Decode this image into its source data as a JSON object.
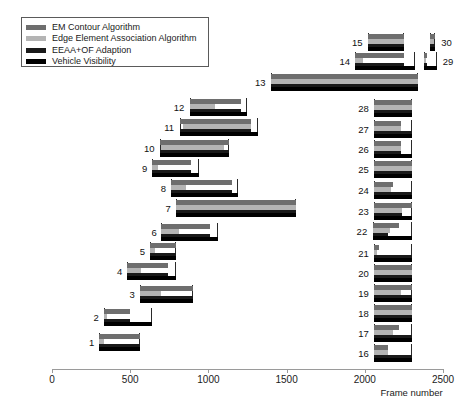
{
  "chart_data": {
    "type": "bar",
    "title": "",
    "xlabel": "Frame number",
    "ylabel": "",
    "xlim": [
      0,
      2500
    ],
    "xticks": [
      0,
      500,
      1000,
      1500,
      2000,
      2500
    ],
    "xticklabels": [
      "0",
      "500",
      "1000",
      "1500",
      "2000",
      "2500"
    ],
    "grid": false,
    "legend_position": "top-left",
    "orientation": "horizontal",
    "series": [
      {
        "name": "EM Contour Algorithm",
        "color": "#6e6e6e"
      },
      {
        "name": "Edge Element Association Algorithm",
        "color": "#b4b4b4"
      },
      {
        "name": "EEAA+OF Adaption",
        "color": "#1a1a1a"
      },
      {
        "name": "Vehicle Visibility",
        "color": "#000000"
      }
    ],
    "groups": [
      {
        "label": "1",
        "column": "left",
        "spans": {
          "EM Contour Algorithm": [
            300,
            560
          ],
          "Edge Element Association Algorithm": [
            300,
            330
          ],
          "EEAA+OF Adaption": [
            300,
            560
          ],
          "Vehicle Visibility": [
            300,
            560
          ]
        }
      },
      {
        "label": "2",
        "column": "left",
        "spans": {
          "EM Contour Algorithm": [
            330,
            500
          ],
          "Edge Element Association Algorithm": [
            330,
            350
          ],
          "EEAA+OF Adaption": [
            330,
            500
          ],
          "Vehicle Visibility": [
            330,
            640
          ]
        }
      },
      {
        "label": "3",
        "column": "left",
        "spans": {
          "EM Contour Algorithm": [
            560,
            900
          ],
          "Edge Element Association Algorithm": [
            560,
            700
          ],
          "EEAA+OF Adaption": [
            560,
            900
          ],
          "Vehicle Visibility": [
            560,
            900
          ]
        }
      },
      {
        "label": "4",
        "column": "left",
        "spans": {
          "EM Contour Algorithm": [
            480,
            740
          ],
          "Edge Element Association Algorithm": [
            480,
            570
          ],
          "EEAA+OF Adaption": [
            480,
            740
          ],
          "Vehicle Visibility": [
            480,
            790
          ]
        }
      },
      {
        "label": "5",
        "column": "left",
        "spans": {
          "EM Contour Algorithm": [
            625,
            790
          ],
          "Edge Element Association Algorithm": [
            625,
            660
          ],
          "EEAA+OF Adaption": [
            625,
            790
          ],
          "Vehicle Visibility": [
            625,
            790
          ]
        }
      },
      {
        "label": "6",
        "column": "left",
        "spans": {
          "EM Contour Algorithm": [
            700,
            1010
          ],
          "Edge Element Association Algorithm": [
            700,
            810
          ],
          "EEAA+OF Adaption": [
            700,
            1010
          ],
          "Vehicle Visibility": [
            700,
            1060
          ]
        }
      },
      {
        "label": "7",
        "column": "left",
        "spans": {
          "EM Contour Algorithm": [
            790,
            1560
          ],
          "Edge Element Association Algorithm": [
            790,
            1560
          ],
          "EEAA+OF Adaption": [
            790,
            1560
          ],
          "Vehicle Visibility": [
            790,
            1560
          ]
        }
      },
      {
        "label": "8",
        "column": "left",
        "spans": {
          "EM Contour Algorithm": [
            760,
            1150
          ],
          "Edge Element Association Algorithm": [
            760,
            860
          ],
          "EEAA+OF Adaption": [
            760,
            1150
          ],
          "Vehicle Visibility": [
            760,
            1190
          ]
        }
      },
      {
        "label": "9",
        "column": "left",
        "spans": {
          "EM Contour Algorithm": [
            640,
            890
          ],
          "Edge Element Association Algorithm": [
            640,
            680
          ],
          "EEAA+OF Adaption": [
            640,
            890
          ],
          "Vehicle Visibility": [
            640,
            940
          ]
        }
      },
      {
        "label": "10",
        "column": "left",
        "spans": {
          "EM Contour Algorithm": [
            690,
            1130
          ],
          "Edge Element Association Algorithm": [
            700,
            1100
          ],
          "EEAA+OF Adaption": [
            690,
            1130
          ],
          "Vehicle Visibility": [
            690,
            1130
          ]
        }
      },
      {
        "label": "11",
        "column": "left",
        "spans": {
          "EM Contour Algorithm": [
            820,
            1270
          ],
          "Edge Element Association Algorithm": [
            840,
            1270
          ],
          "EEAA+OF Adaption": [
            820,
            1270
          ],
          "Vehicle Visibility": [
            820,
            1320
          ]
        }
      },
      {
        "label": "12",
        "column": "left",
        "spans": {
          "EM Contour Algorithm": [
            880,
            1210
          ],
          "Edge Element Association Algorithm": [
            880,
            1040
          ],
          "EEAA+OF Adaption": [
            880,
            1210
          ],
          "Vehicle Visibility": [
            880,
            1250
          ]
        }
      },
      {
        "label": "13",
        "column": "left",
        "spans": {
          "EM Contour Algorithm": [
            1400,
            2340
          ],
          "Edge Element Association Algorithm": [
            1400,
            2340
          ],
          "EEAA+OF Adaption": [
            1400,
            2340
          ],
          "Vehicle Visibility": [
            1400,
            2340
          ]
        }
      },
      {
        "label": "14",
        "column": "left",
        "spans": {
          "EM Contour Algorithm": [
            1940,
            2250
          ],
          "Edge Element Association Algorithm": [
            1940,
            1990
          ],
          "EEAA+OF Adaption": [
            1940,
            2250
          ],
          "Vehicle Visibility": [
            1940,
            2320
          ]
        }
      },
      {
        "label": "15",
        "column": "left",
        "spans": {
          "EM Contour Algorithm": [
            2020,
            2250
          ],
          "Edge Element Association Algorithm": [
            2020,
            2250
          ],
          "EEAA+OF Adaption": [
            2020,
            2250
          ],
          "Vehicle Visibility": [
            2020,
            2250
          ]
        }
      },
      {
        "label": "16",
        "column": "right",
        "spans": {
          "EM Contour Algorithm": [
            2060,
            2150
          ],
          "Edge Element Association Algorithm": [
            2060,
            2150
          ],
          "EEAA+OF Adaption": [
            2060,
            2300
          ],
          "Vehicle Visibility": [
            2060,
            2300
          ]
        }
      },
      {
        "label": "17",
        "column": "right",
        "spans": {
          "EM Contour Algorithm": [
            2060,
            2220
          ],
          "Edge Element Association Algorithm": [
            2060,
            2180
          ],
          "EEAA+OF Adaption": [
            2060,
            2300
          ],
          "Vehicle Visibility": [
            2060,
            2300
          ]
        }
      },
      {
        "label": "18",
        "column": "right",
        "spans": {
          "EM Contour Algorithm": [
            2060,
            2300
          ],
          "Edge Element Association Algorithm": [
            2060,
            2300
          ],
          "EEAA+OF Adaption": [
            2060,
            2300
          ],
          "Vehicle Visibility": [
            2060,
            2300
          ]
        }
      },
      {
        "label": "19",
        "column": "right",
        "spans": {
          "EM Contour Algorithm": [
            2060,
            2300
          ],
          "Edge Element Association Algorithm": [
            2060,
            2230
          ],
          "EEAA+OF Adaption": [
            2060,
            2300
          ],
          "Vehicle Visibility": [
            2060,
            2300
          ]
        }
      },
      {
        "label": "20",
        "column": "right",
        "spans": {
          "EM Contour Algorithm": [
            2060,
            2300
          ],
          "Edge Element Association Algorithm": [
            2060,
            2300
          ],
          "EEAA+OF Adaption": [
            2060,
            2300
          ],
          "Vehicle Visibility": [
            2060,
            2300
          ]
        }
      },
      {
        "label": "21",
        "column": "right",
        "spans": {
          "EM Contour Algorithm": [
            2060,
            2090
          ],
          "Edge Element Association Algorithm": [
            2060,
            2080
          ],
          "EEAA+OF Adaption": [
            2060,
            2300
          ],
          "Vehicle Visibility": [
            2060,
            2300
          ]
        }
      },
      {
        "label": "22",
        "column": "right",
        "spans": {
          "EM Contour Algorithm": [
            2050,
            2220
          ],
          "Edge Element Association Algorithm": [
            2050,
            2160
          ],
          "EEAA+OF Adaption": [
            2050,
            2150
          ],
          "Vehicle Visibility": [
            2050,
            2300
          ]
        }
      },
      {
        "label": "23",
        "column": "right",
        "spans": {
          "EM Contour Algorithm": [
            2060,
            2300
          ],
          "Edge Element Association Algorithm": [
            2060,
            2240
          ],
          "EEAA+OF Adaption": [
            2060,
            2240
          ],
          "Vehicle Visibility": [
            2060,
            2300
          ]
        }
      },
      {
        "label": "24",
        "column": "right",
        "spans": {
          "EM Contour Algorithm": [
            2060,
            2180
          ],
          "Edge Element Association Algorithm": [
            2060,
            2170
          ],
          "EEAA+OF Adaption": [
            2060,
            2300
          ],
          "Vehicle Visibility": [
            2060,
            2300
          ]
        }
      },
      {
        "label": "25",
        "column": "right",
        "spans": {
          "EM Contour Algorithm": [
            2060,
            2300
          ],
          "Edge Element Association Algorithm": [
            2060,
            2300
          ],
          "EEAA+OF Adaption": [
            2060,
            2300
          ],
          "Vehicle Visibility": [
            2060,
            2300
          ]
        }
      },
      {
        "label": "26",
        "column": "right",
        "spans": {
          "EM Contour Algorithm": [
            2060,
            2230
          ],
          "Edge Element Association Algorithm": [
            2060,
            2230
          ],
          "EEAA+OF Adaption": [
            2060,
            2230
          ],
          "Vehicle Visibility": [
            2060,
            2300
          ]
        }
      },
      {
        "label": "27",
        "column": "right",
        "spans": {
          "EM Contour Algorithm": [
            2060,
            2230
          ],
          "Edge Element Association Algorithm": [
            2060,
            2230
          ],
          "EEAA+OF Adaption": [
            2060,
            2300
          ],
          "Vehicle Visibility": [
            2060,
            2300
          ]
        }
      },
      {
        "label": "28",
        "column": "right",
        "spans": {
          "EM Contour Algorithm": [
            2060,
            2300
          ],
          "Edge Element Association Algorithm": [
            2060,
            2300
          ],
          "EEAA+OF Adaption": [
            2060,
            2300
          ],
          "Vehicle Visibility": [
            2060,
            2300
          ]
        }
      },
      {
        "label": "29",
        "column": "right",
        "spans": {
          "EM Contour Algorithm": [
            2380,
            2400
          ],
          "Edge Element Association Algorithm": [
            2380,
            2390
          ],
          "EEAA+OF Adaption": [
            2380,
            2400
          ],
          "Vehicle Visibility": [
            2380,
            2460
          ]
        }
      },
      {
        "label": "30",
        "column": "right",
        "spans": {
          "EM Contour Algorithm": [
            2420,
            2450
          ],
          "Edge Element Association Algorithm": [
            2420,
            2445
          ],
          "EEAA+OF Adaption": [
            2420,
            2450
          ],
          "Vehicle Visibility": [
            2420,
            2450
          ]
        }
      }
    ]
  },
  "legend": {
    "items": [
      {
        "label": "EM Contour Algorithm",
        "color": "#6e6e6e"
      },
      {
        "label": "Edge Element Association Algorithm",
        "color": "#b4b4b4"
      },
      {
        "label": "EEAA+OF Adaption",
        "color": "#1a1a1a"
      },
      {
        "label": "Vehicle Visibility",
        "color": "#000000"
      }
    ]
  },
  "axis": {
    "xlabel": "Frame number",
    "ticks": [
      "0",
      "500",
      "1000",
      "1500",
      "2000",
      "2500"
    ]
  }
}
